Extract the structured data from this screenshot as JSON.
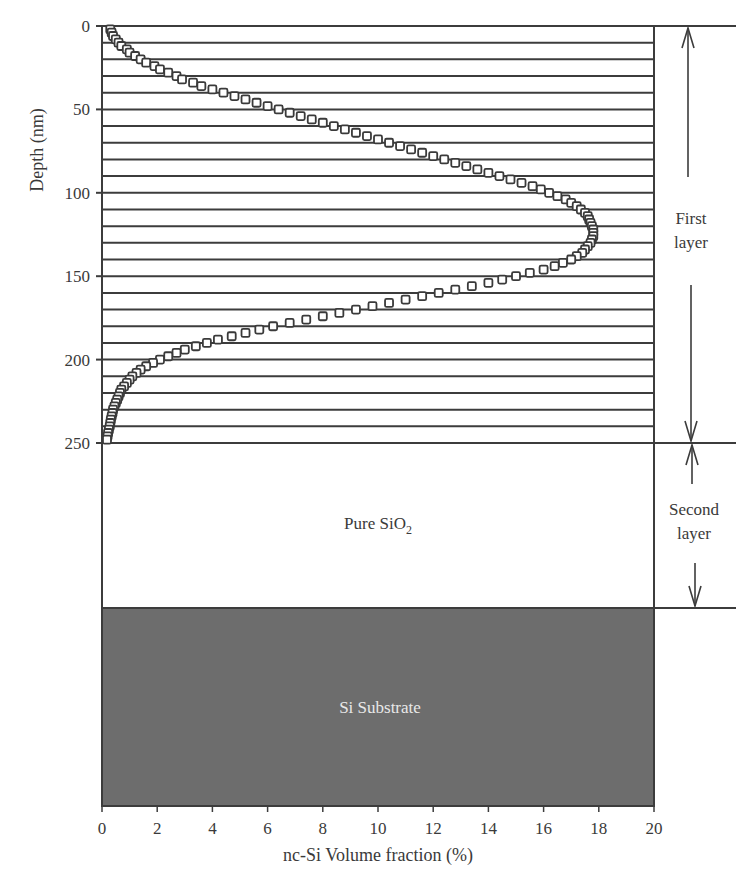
{
  "chart_data": {
    "type": "scatter",
    "title": "",
    "xlabel": "nc-Si Volume fraction (%)",
    "ylabel": "Depth (nm)",
    "xlim": [
      0,
      20
    ],
    "ylim": [
      0,
      250
    ],
    "y_inverted": true,
    "x_ticks": [
      0,
      2,
      4,
      6,
      8,
      10,
      12,
      14,
      16,
      18,
      20
    ],
    "y_ticks": [
      0,
      50,
      100,
      150,
      200,
      250
    ],
    "grid": "horizontal lines every 10 nm from 0 to 250 nm",
    "marker": "open square",
    "series": [
      {
        "name": "nc-Si volume fraction profile",
        "points": [
          [
            0.3,
            2
          ],
          [
            0.35,
            4
          ],
          [
            0.4,
            6
          ],
          [
            0.5,
            8
          ],
          [
            0.6,
            10
          ],
          [
            0.7,
            12
          ],
          [
            0.9,
            14
          ],
          [
            1.0,
            16
          ],
          [
            1.2,
            18
          ],
          [
            1.4,
            20
          ],
          [
            1.6,
            22
          ],
          [
            1.9,
            24
          ],
          [
            2.1,
            26
          ],
          [
            2.4,
            28
          ],
          [
            2.7,
            30
          ],
          [
            2.9,
            32
          ],
          [
            3.3,
            34
          ],
          [
            3.6,
            36
          ],
          [
            4.0,
            38
          ],
          [
            4.4,
            40
          ],
          [
            4.8,
            42
          ],
          [
            5.2,
            44
          ],
          [
            5.6,
            46
          ],
          [
            6.0,
            48
          ],
          [
            6.4,
            50
          ],
          [
            6.8,
            52
          ],
          [
            7.2,
            54
          ],
          [
            7.6,
            56
          ],
          [
            8.0,
            58
          ],
          [
            8.4,
            60
          ],
          [
            8.8,
            62
          ],
          [
            9.2,
            64
          ],
          [
            9.6,
            66
          ],
          [
            10.0,
            68
          ],
          [
            10.4,
            70
          ],
          [
            10.8,
            72
          ],
          [
            11.2,
            74
          ],
          [
            11.6,
            76
          ],
          [
            12.0,
            78
          ],
          [
            12.4,
            80
          ],
          [
            12.8,
            82
          ],
          [
            13.2,
            84
          ],
          [
            13.6,
            86
          ],
          [
            14.0,
            88
          ],
          [
            14.4,
            90
          ],
          [
            14.8,
            92
          ],
          [
            15.2,
            94
          ],
          [
            15.6,
            96
          ],
          [
            15.9,
            98
          ],
          [
            16.2,
            100
          ],
          [
            16.5,
            102
          ],
          [
            16.8,
            104
          ],
          [
            17.0,
            106
          ],
          [
            17.2,
            108
          ],
          [
            17.35,
            110
          ],
          [
            17.5,
            112
          ],
          [
            17.6,
            114
          ],
          [
            17.65,
            116
          ],
          [
            17.7,
            118
          ],
          [
            17.75,
            120
          ],
          [
            17.8,
            122
          ],
          [
            17.8,
            124
          ],
          [
            17.8,
            126
          ],
          [
            17.75,
            128
          ],
          [
            17.7,
            130
          ],
          [
            17.6,
            132
          ],
          [
            17.5,
            134
          ],
          [
            17.4,
            136
          ],
          [
            17.2,
            138
          ],
          [
            17.0,
            140
          ],
          [
            16.7,
            142
          ],
          [
            16.4,
            144
          ],
          [
            16.0,
            146
          ],
          [
            15.5,
            148
          ],
          [
            15.0,
            150
          ],
          [
            14.5,
            152
          ],
          [
            14.0,
            154
          ],
          [
            13.4,
            156
          ],
          [
            12.8,
            158
          ],
          [
            12.2,
            160
          ],
          [
            11.6,
            162
          ],
          [
            11.0,
            164
          ],
          [
            10.4,
            166
          ],
          [
            9.8,
            168
          ],
          [
            9.2,
            170
          ],
          [
            8.6,
            172
          ],
          [
            8.0,
            174
          ],
          [
            7.4,
            176
          ],
          [
            6.8,
            178
          ],
          [
            6.2,
            180
          ],
          [
            5.7,
            182
          ],
          [
            5.2,
            184
          ],
          [
            4.7,
            186
          ],
          [
            4.2,
            188
          ],
          [
            3.8,
            190
          ],
          [
            3.4,
            192
          ],
          [
            3.0,
            194
          ],
          [
            2.7,
            196
          ],
          [
            2.4,
            198
          ],
          [
            2.1,
            200
          ],
          [
            1.85,
            202
          ],
          [
            1.6,
            204
          ],
          [
            1.4,
            206
          ],
          [
            1.25,
            208
          ],
          [
            1.1,
            210
          ],
          [
            1.0,
            212
          ],
          [
            0.9,
            214
          ],
          [
            0.8,
            216
          ],
          [
            0.7,
            218
          ],
          [
            0.65,
            220
          ],
          [
            0.6,
            222
          ],
          [
            0.55,
            224
          ],
          [
            0.5,
            226
          ],
          [
            0.45,
            228
          ],
          [
            0.4,
            230
          ],
          [
            0.38,
            232
          ],
          [
            0.35,
            234
          ],
          [
            0.32,
            236
          ],
          [
            0.3,
            238
          ],
          [
            0.28,
            240
          ],
          [
            0.25,
            242
          ],
          [
            0.22,
            244
          ],
          [
            0.2,
            246
          ],
          [
            0.18,
            248
          ]
        ]
      }
    ],
    "regions": [
      {
        "name": "first_layer",
        "depth_range": [
          0,
          250
        ],
        "fill": "#ffffff",
        "label": ""
      },
      {
        "name": "pure_sio2",
        "label": "Pure SiO",
        "label_subscript": "2",
        "fill": "#ffffff"
      },
      {
        "name": "si_substrate",
        "label": "Si Substrate",
        "fill": "#6d6d6d",
        "label_color": "#e6e6e6"
      }
    ],
    "annotations": [
      {
        "label_line1": "First",
        "label_line2": "layer",
        "type": "double-arrow",
        "span": "0-250 nm"
      },
      {
        "label_line1": "Second",
        "label_line2": "layer",
        "type": "double-arrow",
        "span": "Pure SiO2 region"
      }
    ]
  },
  "labels": {
    "xlabel": "nc-Si Volume fraction (%)",
    "ylabel": "Depth (nm)",
    "pure_sio2_main": "Pure SiO",
    "pure_sio2_sub": "2",
    "substrate": "Si Substrate",
    "first_layer_1": "First",
    "first_layer_2": "layer",
    "second_layer_1": "Second",
    "second_layer_2": "layer"
  },
  "colors": {
    "line": "#3c3c3c",
    "substrate": "#6d6d6d",
    "substrate_text": "#e8e8e8",
    "marker_stroke": "#3a3a3a"
  }
}
